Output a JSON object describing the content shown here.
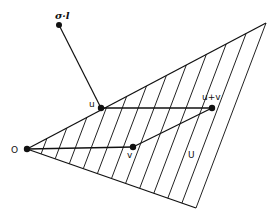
{
  "diagram": {
    "labels": {
      "origin": "O",
      "u": "u",
      "v": "v",
      "u_plus_v": "u+v",
      "cone": "U",
      "sigma_l": "σ·l"
    },
    "points": {
      "origin": [
        27,
        149
      ],
      "sigma_l": [
        59,
        25
      ],
      "u": [
        101,
        108
      ],
      "v": [
        133,
        147
      ],
      "u_plus_v": [
        212,
        108
      ]
    },
    "cone": {
      "upper_edge_end": [
        266,
        23
      ],
      "lower_edge_end": [
        196,
        208
      ],
      "hatched": true
    },
    "colors": {
      "ink": "#111111",
      "background": "#ffffff"
    }
  }
}
